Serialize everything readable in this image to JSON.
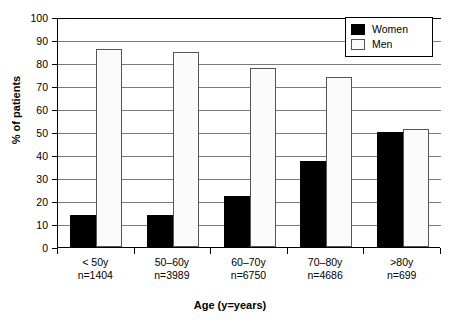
{
  "chart_data": {
    "type": "bar",
    "title": "",
    "xlabel": "Age (y=years)",
    "ylabel": "% of patients",
    "ylim": [
      0,
      100
    ],
    "ytick_step": 10,
    "yticks": [
      0,
      10,
      20,
      30,
      40,
      50,
      60,
      70,
      80,
      90,
      100
    ],
    "grid": true,
    "legend_position": "top-right",
    "categories": [
      "< 50y",
      "50–60y",
      "60–70y",
      "70–80y",
      ">80y"
    ],
    "category_counts": [
      "n=1404",
      "n=3989",
      "n=6750",
      "n=4686",
      "n=699"
    ],
    "category_labels": [
      [
        "< 50y",
        "n=1404"
      ],
      [
        "50–60y",
        "n=3989"
      ],
      [
        "60–70y",
        "n=6750"
      ],
      [
        "70–80y",
        "n=4686"
      ],
      [
        ">80y",
        "n=699"
      ]
    ],
    "series": [
      {
        "name": "Women",
        "fill": "solid-black",
        "color": "#000000",
        "values": [
          14,
          14,
          22,
          37.5,
          50
        ]
      },
      {
        "name": "Men",
        "fill": "dotted-stipple",
        "color": "#fbfbfb",
        "values": [
          86,
          85,
          78,
          74,
          51.5
        ]
      }
    ]
  },
  "legend": {
    "items": [
      {
        "label": "Women"
      },
      {
        "label": "Men"
      }
    ]
  },
  "axes": {
    "y_title": "% of patients",
    "x_title": "Age (y=years)"
  }
}
